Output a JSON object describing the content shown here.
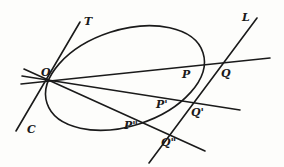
{
  "diagram": {
    "labels": {
      "O": "O",
      "T": "T",
      "L": "L",
      "C": "C",
      "P": "P",
      "Q": "Q",
      "P1": "P'",
      "Q1": "Q'",
      "P2": "P\"",
      "Q2": "Q\""
    },
    "colors": {
      "stroke": "#1a1a1a",
      "background": "#fdfdfb"
    }
  }
}
